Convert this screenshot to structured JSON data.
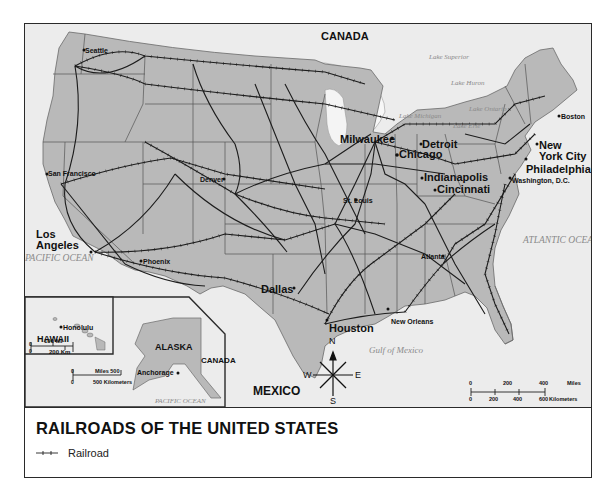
{
  "map": {
    "title": "RAILROADS OF THE UNITED STATES",
    "legend": [
      {
        "symbol": "railroad-line-icon",
        "label": "Railroad"
      }
    ],
    "countries": {
      "canada_top": "CANADA",
      "canada_alaska": "CANADA",
      "mexico": "MEXICO"
    },
    "water_bodies": {
      "lake_superior": "Lake Superior",
      "lake_huron": "Lake Huron",
      "lake_michigan": "Lake Michigan",
      "lake_ontario": "Lake Ontario",
      "lake_erie": "Lake Erie",
      "pacific_ocean_main": "PACIFIC OCEAN",
      "pacific_ocean_alaska": "PACIFIC OCEAN",
      "atlantic_ocean": "ATLANTIC OCEAN",
      "gulf_of_mexico": "Gulf of Mexico"
    },
    "cities": [
      {
        "name": "Seattle",
        "size": "small"
      },
      {
        "name": "San Francisco",
        "size": "small"
      },
      {
        "name": "Los Angeles",
        "size": "large"
      },
      {
        "name": "Phoenix",
        "size": "small"
      },
      {
        "name": "Denver",
        "size": "small"
      },
      {
        "name": "Dallas",
        "size": "large"
      },
      {
        "name": "Houston",
        "size": "large"
      },
      {
        "name": "St. Louis",
        "size": "small"
      },
      {
        "name": "Milwaukee",
        "size": "large"
      },
      {
        "name": "Chicago",
        "size": "large"
      },
      {
        "name": "Detroit",
        "size": "large"
      },
      {
        "name": "Indianapolis",
        "size": "large"
      },
      {
        "name": "Cincinnati",
        "size": "large"
      },
      {
        "name": "Atlanta",
        "size": "small"
      },
      {
        "name": "New Orleans",
        "size": "small"
      },
      {
        "name": "Washington, D.C.",
        "size": "small"
      },
      {
        "name": "Philadelphia",
        "size": "large"
      },
      {
        "name": "New York City",
        "size": "large"
      },
      {
        "name": "Boston",
        "size": "small"
      },
      {
        "name": "Honolulu",
        "size": "small"
      },
      {
        "name": "Anchorage",
        "size": "small"
      }
    ],
    "insets": {
      "hawaii": {
        "label": "HAWAII",
        "scale_top": "100 MI",
        "scale_bottom": "200 Km",
        "zero": "0"
      },
      "alaska": {
        "label": "ALASKA",
        "scale_top": "Miles 500",
        "scale_bottom": "500 Kilometers",
        "zero": "0"
      }
    },
    "compass": {
      "n": "N",
      "s": "S",
      "e": "E",
      "w": "W"
    },
    "scale_bar": {
      "miles_ticks": [
        "0",
        "200",
        "400"
      ],
      "miles_label": "Miles",
      "km_ticks": [
        "0",
        "200",
        "400",
        "600"
      ],
      "km_label": "Kilometers"
    },
    "colors": {
      "land": "#b9b9b9",
      "foreign_land": "#ececec",
      "water": "#ececec",
      "rail": "#1e1e1e",
      "border": "#333333"
    }
  }
}
